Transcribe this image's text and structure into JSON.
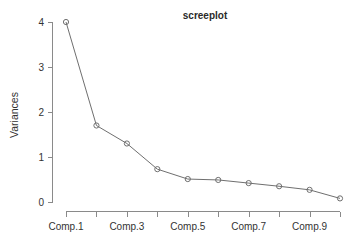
{
  "chart_data": {
    "type": "line",
    "title": "screeplot",
    "xlabel": "",
    "ylabel": "Variances",
    "categories": [
      "Comp.1",
      "Comp.2",
      "Comp.3",
      "Comp.4",
      "Comp.5",
      "Comp.6",
      "Comp.7",
      "Comp.8",
      "Comp.9",
      "Comp.10"
    ],
    "values": [
      4.0,
      1.7,
      1.3,
      0.73,
      0.51,
      0.49,
      0.42,
      0.35,
      0.27,
      0.08
    ],
    "series": [
      {
        "name": "Variances",
        "values": [
          4.0,
          1.7,
          1.3,
          0.73,
          0.51,
          0.49,
          0.42,
          0.35,
          0.27,
          0.08
        ]
      }
    ],
    "ylim": [
      0,
      4
    ],
    "xlim": [
      0.5,
      10.5
    ],
    "y_ticks": [
      0,
      1,
      2,
      3,
      4
    ],
    "y_tick_labels": [
      "0",
      "1",
      "2",
      "3",
      "4"
    ],
    "x_tick_labels": [
      "Comp.1",
      "",
      "Comp.3",
      "",
      "Comp.5",
      "",
      "Comp.7",
      "",
      "Comp.9",
      ""
    ],
    "x_visible_labels": [
      "Comp.1",
      "Comp.3",
      "Comp.5",
      "Comp.7",
      "Comp.9"
    ],
    "grid": false,
    "legend": "none",
    "marker": "open-circle",
    "colors": {
      "line": "#6f6f6f",
      "marker": "#6f6f6f",
      "axis": "#8a8a8a",
      "text": "#333333",
      "title": "#2a2a2a",
      "background": "#ffffff"
    }
  }
}
